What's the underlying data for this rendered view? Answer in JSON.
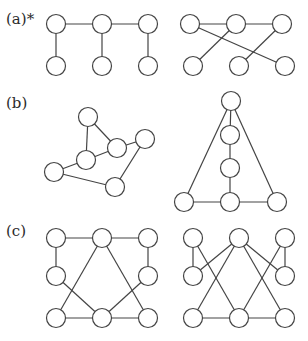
{
  "style": {
    "stroke": "#444444",
    "fill": "#ffffff",
    "node_radius": 9.5,
    "stroke_width": 1.2
  },
  "rows": [
    {
      "label": "(a)*",
      "label_pos": [
        6,
        10
      ],
      "graphs": [
        {
          "name": "graph-a-left",
          "nodes": [
            [
              56,
              24
            ],
            [
              102,
              24
            ],
            [
              148,
              24
            ],
            [
              56,
              66
            ],
            [
              102,
              66
            ],
            [
              148,
              66
            ]
          ],
          "edges": [
            [
              0,
              1
            ],
            [
              1,
              2
            ],
            [
              0,
              3
            ],
            [
              1,
              4
            ],
            [
              2,
              5
            ]
          ]
        },
        {
          "name": "graph-a-right",
          "nodes": [
            [
              190,
              24
            ],
            [
              236,
              24
            ],
            [
              282,
              24
            ],
            [
              193,
              66
            ],
            [
              239,
              66
            ],
            [
              285,
              66
            ]
          ],
          "edges": [
            [
              0,
              1
            ],
            [
              1,
              2
            ],
            [
              0,
              5
            ],
            [
              1,
              3
            ],
            [
              2,
              4
            ]
          ]
        }
      ]
    },
    {
      "label": "(b)",
      "label_pos": [
        6,
        94
      ],
      "graphs": [
        {
          "name": "graph-b-left",
          "nodes": [
            [
              88,
              117
            ],
            [
              117,
              148
            ],
            [
              86,
              160
            ],
            [
              54,
              172
            ],
            [
              115,
              187
            ],
            [
              145,
              139
            ]
          ],
          "edges": [
            [
              0,
              2
            ],
            [
              0,
              1
            ],
            [
              1,
              2
            ],
            [
              1,
              5
            ],
            [
              2,
              3
            ],
            [
              3,
              4
            ],
            [
              4,
              5
            ]
          ]
        },
        {
          "name": "graph-b-right",
          "nodes": [
            [
              231,
              101
            ],
            [
              230,
              135
            ],
            [
              230,
              168
            ],
            [
              184,
              202
            ],
            [
              230,
              202
            ],
            [
              277,
              202
            ]
          ],
          "edges": [
            [
              0,
              3
            ],
            [
              0,
              5
            ],
            [
              0,
              1
            ],
            [
              1,
              2
            ],
            [
              2,
              4
            ],
            [
              3,
              4
            ],
            [
              4,
              5
            ]
          ]
        }
      ]
    },
    {
      "label": "(c)",
      "label_pos": [
        6,
        222
      ],
      "graphs": [
        {
          "name": "graph-c-left",
          "nodes": [
            [
              56,
              238
            ],
            [
              102,
              238
            ],
            [
              148,
              238
            ],
            [
              56,
              276
            ],
            [
              148,
              276
            ],
            [
              56,
              318
            ],
            [
              102,
              318
            ],
            [
              148,
              318
            ]
          ],
          "edges": [
            [
              0,
              1
            ],
            [
              1,
              2
            ],
            [
              0,
              3
            ],
            [
              2,
              4
            ],
            [
              1,
              5
            ],
            [
              1,
              7
            ],
            [
              3,
              6
            ],
            [
              4,
              6
            ],
            [
              5,
              6
            ],
            [
              6,
              7
            ]
          ]
        },
        {
          "name": "graph-c-right",
          "nodes": [
            [
              193,
              238
            ],
            [
              239,
              238
            ],
            [
              285,
              238
            ],
            [
              193,
              276
            ],
            [
              285,
              276
            ],
            [
              193,
              318
            ],
            [
              239,
              318
            ],
            [
              285,
              318
            ]
          ],
          "edges": [
            [
              0,
              3
            ],
            [
              2,
              4
            ],
            [
              0,
              6
            ],
            [
              1,
              3
            ],
            [
              1,
              5
            ],
            [
              1,
              7
            ],
            [
              1,
              4
            ],
            [
              2,
              6
            ],
            [
              5,
              6
            ],
            [
              6,
              7
            ]
          ]
        }
      ]
    }
  ]
}
